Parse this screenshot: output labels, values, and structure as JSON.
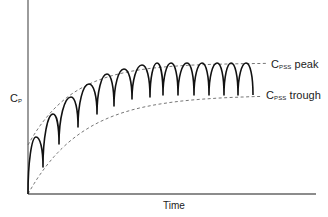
{
  "chart_data": {
    "type": "line",
    "title": "",
    "xlabel": "Time",
    "ylabel": {
      "main": "C",
      "sub": "P"
    },
    "grid": false,
    "legend": "none",
    "annotations": [
      {
        "id": "peak",
        "main": "C",
        "sub": "PSS",
        "text": " peak",
        "full": "CPSS peak"
      },
      {
        "id": "trough",
        "main": "C",
        "sub": "PSS",
        "text": " trough",
        "full": "CPSS trough"
      }
    ],
    "axes": {
      "origin_px": [
        28,
        194
      ],
      "x_end_px": 316,
      "y_top_px": 0
    },
    "series": [
      {
        "name": "Plasma concentration (repeated dosing)",
        "style": "solid",
        "peaks_px": [
          [
            36,
            137
          ],
          [
            53,
            114
          ],
          [
            71,
            97
          ],
          [
            89,
            84
          ],
          [
            107,
            74
          ],
          [
            124,
            69
          ],
          [
            142,
            65
          ],
          [
            157,
            63
          ],
          [
            171,
            63
          ],
          [
            187,
            63
          ],
          [
            202,
            63
          ],
          [
            217,
            63
          ],
          [
            231,
            63
          ],
          [
            246,
            63
          ]
        ],
        "troughs_px": [
          [
            28,
            194
          ],
          [
            43,
            167
          ],
          [
            59,
            144
          ],
          [
            78,
            127
          ],
          [
            97,
            114
          ],
          [
            114,
            106
          ],
          [
            132,
            99
          ],
          [
            150,
            97
          ],
          [
            163,
            95
          ],
          [
            178,
            95
          ],
          [
            194,
            95
          ],
          [
            209,
            95
          ],
          [
            224,
            95
          ],
          [
            238,
            95
          ],
          [
            253,
            95
          ]
        ]
      },
      {
        "name": "Peak envelope",
        "style": "dashed",
        "start_px": [
          28,
          145
        ],
        "plateau_y_px": 63,
        "end_x_px": 266
      },
      {
        "name": "Trough envelope",
        "style": "dashed",
        "start_px": [
          28,
          194
        ],
        "plateau_y_px": 95,
        "end_x_px": 262
      }
    ]
  },
  "colors": {
    "axis": "#666666",
    "curve": "#111111",
    "dashed": "#666666",
    "text": "#222222"
  }
}
